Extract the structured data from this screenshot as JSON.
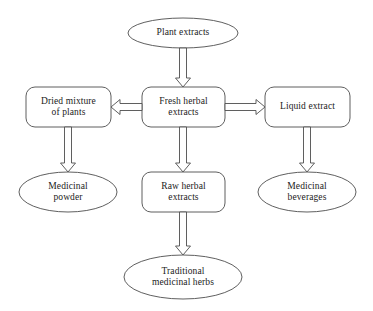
{
  "diagram": {
    "stroke_color": "#4d4d4d",
    "text_color": "#1b1b1b",
    "background_color": "#ffffff",
    "nodes": [
      {
        "id": "plant-extracts",
        "shape": "ellipse",
        "label": "Plant extracts",
        "cx": 183,
        "cy": 33,
        "rx": 55,
        "ry": 15
      },
      {
        "id": "dried-mixture-of-plants",
        "shape": "rounded-rect",
        "label": "Dried mixture\nof plants",
        "x": 26,
        "y": 87,
        "w": 85,
        "h": 40
      },
      {
        "id": "fresh-herbal-extracts",
        "shape": "rounded-rect",
        "label": "Fresh herbal\nextracts",
        "x": 142,
        "y": 87,
        "w": 83,
        "h": 40
      },
      {
        "id": "liquid-extract",
        "shape": "rounded-rect",
        "label": "Liquid extract",
        "x": 265,
        "y": 87,
        "w": 85,
        "h": 40
      },
      {
        "id": "medicinal-powder",
        "shape": "ellipse",
        "label": "Medicinal\npowder",
        "cx": 68,
        "cy": 192,
        "rx": 49,
        "ry": 20
      },
      {
        "id": "raw-herbal-extracts",
        "shape": "rounded-rect",
        "label": "Raw herbal\nextracts",
        "x": 142,
        "y": 172,
        "w": 83,
        "h": 40
      },
      {
        "id": "medicinal-beverages",
        "shape": "ellipse",
        "label": "Medicinal\nbeverages",
        "cx": 307,
        "cy": 192,
        "rx": 49,
        "ry": 20
      },
      {
        "id": "traditional-medicinal-herbs",
        "shape": "ellipse",
        "label": "Traditional\nmedicinal herbs",
        "cx": 183,
        "cy": 277,
        "rx": 59,
        "ry": 22
      }
    ],
    "arrows": [
      {
        "id": "arrow-plant-to-fresh",
        "from": "plant-extracts",
        "to": "fresh-herbal-extracts",
        "direction": "down"
      },
      {
        "id": "arrow-fresh-to-dried",
        "from": "fresh-herbal-extracts",
        "to": "dried-mixture-of-plants",
        "direction": "left"
      },
      {
        "id": "arrow-fresh-to-liquid",
        "from": "fresh-herbal-extracts",
        "to": "liquid-extract",
        "direction": "right"
      },
      {
        "id": "arrow-dried-to-powder",
        "from": "dried-mixture-of-plants",
        "to": "medicinal-powder",
        "direction": "down"
      },
      {
        "id": "arrow-fresh-to-raw",
        "from": "fresh-herbal-extracts",
        "to": "raw-herbal-extracts",
        "direction": "down"
      },
      {
        "id": "arrow-liquid-to-beverages",
        "from": "liquid-extract",
        "to": "medicinal-beverages",
        "direction": "down"
      },
      {
        "id": "arrow-raw-to-traditional",
        "from": "raw-herbal-extracts",
        "to": "traditional-medicinal-herbs",
        "direction": "down"
      }
    ]
  }
}
